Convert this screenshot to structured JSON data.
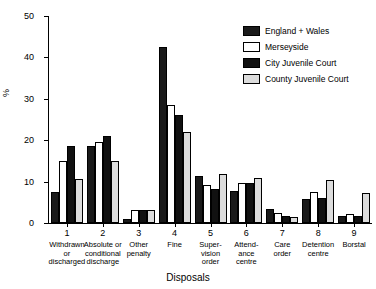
{
  "chart_data": {
    "type": "bar",
    "title": "",
    "xlabel": "Disposals",
    "ylabel": "%",
    "ylim": [
      0,
      50
    ],
    "yticks": [
      0,
      10,
      20,
      30,
      40,
      50
    ],
    "grid": false,
    "legend_position": "top-right",
    "categories": [
      "1",
      "2",
      "3",
      "4",
      "5",
      "6",
      "7",
      "8",
      "9"
    ],
    "category_labels": [
      "Withdrawn or discharged",
      "Absolute or conditional discharge",
      "Other penalty",
      "Fine",
      "Super-vision order",
      "Attend-ance centre",
      "Care order",
      "Detention centre",
      "Borstal"
    ],
    "category_label_lines": [
      [
        "Withdrawn",
        "or",
        "discharged"
      ],
      [
        "Absolute or",
        "conditional",
        "discharge"
      ],
      [
        "Other",
        "penalty"
      ],
      [
        "Fine"
      ],
      [
        "Super-",
        "vision",
        "order"
      ],
      [
        "Attend-",
        "ance",
        "centre"
      ],
      [
        "Care",
        "order"
      ],
      [
        "Detention",
        "centre"
      ],
      [
        "Borstal"
      ]
    ],
    "series": [
      {
        "name": "England + Wales",
        "color": "#1a1a1a",
        "values": [
          7.5,
          18.7,
          1.0,
          42.5,
          11.3,
          7.8,
          3.5,
          5.8,
          1.7
        ]
      },
      {
        "name": "Merseyside",
        "color": "#ffffff",
        "values": [
          15.0,
          19.6,
          3.2,
          28.5,
          9.2,
          9.6,
          2.5,
          7.5,
          2.2
        ]
      },
      {
        "name": "City Juvenile Court",
        "color": "#111111",
        "values": [
          18.5,
          21.0,
          3.2,
          26.0,
          8.3,
          9.7,
          1.6,
          6.0,
          1.8
        ]
      },
      {
        "name": "County Juvenile Court",
        "color": "#dcdcdc",
        "values": [
          10.7,
          15.0,
          3.2,
          22.0,
          11.8,
          10.8,
          1.4,
          10.5,
          7.3
        ]
      }
    ]
  }
}
